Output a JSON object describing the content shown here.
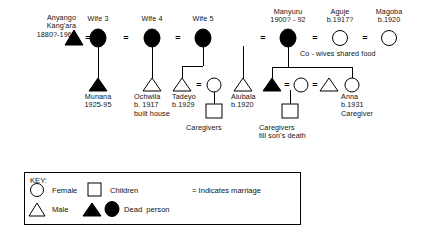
{
  "diagram": {
    "type": "genealogy-kinship-chart",
    "colors": {
      "ink": "#000000",
      "background": "#ffffff"
    },
    "marriage_symbol": "=",
    "people": [
      {
        "id": "anyango",
        "label": "Anyango\nKang'ara\n1880?-1964",
        "shape": "triangle",
        "filled": true,
        "x": 74,
        "y": 38,
        "label_x": 42,
        "label_y": 14,
        "label_align": "right"
      },
      {
        "id": "wife3",
        "label": "Wife 3",
        "shape": "circle",
        "filled": true,
        "x": 98,
        "y": 38,
        "label_x": 98,
        "label_y": 15
      },
      {
        "id": "wife4",
        "label": "Wife 4",
        "shape": "circle",
        "filled": true,
        "x": 152,
        "y": 38,
        "label_x": 152,
        "label_y": 15
      },
      {
        "id": "wife5",
        "label": "Wife 5",
        "shape": "circle",
        "filled": true,
        "x": 203,
        "y": 38,
        "label_x": 203,
        "label_y": 15
      },
      {
        "id": "manyuru",
        "label": "Manyuru\n1900? - 92",
        "shape": "circle",
        "filled": true,
        "x": 288,
        "y": 38,
        "label_x": 288,
        "label_y": 8
      },
      {
        "id": "aguje",
        "label": "Aguje\nb.1917?",
        "shape": "circle",
        "filled": false,
        "x": 340,
        "y": 38,
        "label_x": 340,
        "label_y": 8
      },
      {
        "id": "magoba",
        "label": "Magoba\nb.1920",
        "shape": "circle",
        "filled": false,
        "x": 389,
        "y": 38,
        "label_x": 389,
        "label_y": 8
      },
      {
        "id": "munana",
        "label": "Munana\n1925-95",
        "shape": "triangle",
        "filled": true,
        "x": 98,
        "y": 85,
        "label_x": 98,
        "label_y": 93
      },
      {
        "id": "ochwila",
        "label": "Ochwila\nb. 1917\nbuilt house",
        "shape": "triangle",
        "filled": false,
        "x": 152,
        "y": 85,
        "label_x": 150,
        "label_y": 93
      },
      {
        "id": "tadeyo",
        "label": "Tadeyo\nb.1929",
        "shape": "triangle",
        "filled": false,
        "x": 182,
        "y": 85,
        "label_x": 182,
        "label_y": 93
      },
      {
        "id": "tadeyo_wife",
        "label": "",
        "shape": "circle",
        "filled": false,
        "x": 214,
        "y": 85,
        "label_x": 214,
        "label_y": 93
      },
      {
        "id": "alubala",
        "label": "Alubala\nb.1920",
        "shape": "triangle",
        "filled": false,
        "x": 243,
        "y": 85,
        "label_x": 243,
        "label_y": 93
      },
      {
        "id": "son_dead",
        "label": "",
        "shape": "triangle",
        "filled": true,
        "x": 272,
        "y": 85,
        "label_x": 272,
        "label_y": 93
      },
      {
        "id": "son_wife",
        "label": "",
        "shape": "circle",
        "filled": false,
        "x": 301,
        "y": 85,
        "label_x": 301,
        "label_y": 93
      },
      {
        "id": "husband",
        "label": "",
        "shape": "triangle",
        "filled": false,
        "x": 329,
        "y": 85,
        "label_x": 329,
        "label_y": 93
      },
      {
        "id": "anna",
        "label": "Anna\nb.1931\nCaregiver",
        "shape": "circle",
        "filled": false,
        "x": 352,
        "y": 85,
        "label_x": 350,
        "label_y": 93
      }
    ],
    "children_boxes": [
      {
        "id": "children-tadeyo",
        "x": 214,
        "y": 110,
        "label": "Caregivers",
        "label_x": 206,
        "label_y": 122
      },
      {
        "id": "children-son",
        "x": 290,
        "y": 110,
        "label": "Caregivers\ntill son's death",
        "label_x": 278,
        "label_y": 122
      }
    ],
    "annotations": [
      {
        "id": "co-wives-note",
        "text": "Co - wives shared food",
        "x": 331,
        "y": 53
      }
    ]
  },
  "legend": {
    "title": "KEY:",
    "entries": [
      {
        "symbol": "circle-open",
        "label": "Female"
      },
      {
        "symbol": "triangle-open",
        "label": "Male"
      },
      {
        "symbol": "square-open",
        "label": "Children"
      },
      {
        "symbol": "filled-pair",
        "label": "Dead  person"
      },
      {
        "symbol": "equals",
        "label": "Indicates marriage"
      }
    ]
  }
}
